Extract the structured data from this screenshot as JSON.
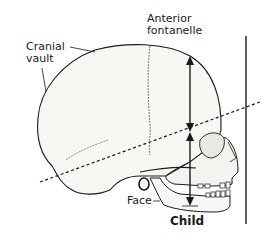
{
  "figure": {
    "type": "anatomical-illustration",
    "labels": {
      "cranial_vault_line1": "Cranial",
      "cranial_vault_line2": "vault",
      "anterior_fontanelle_line1": "Anterior",
      "anterior_fontanelle_line2": "fontanelle",
      "face": "Face",
      "caption": "Child"
    },
    "annotations": [
      {
        "name": "cranial-height-arrow",
        "kind": "double-arrow",
        "orientation": "vertical"
      },
      {
        "name": "face-height-arrow",
        "kind": "double-arrow",
        "orientation": "vertical"
      },
      {
        "name": "orbital-plane-line",
        "kind": "dashed-line"
      },
      {
        "name": "vertical-reference-line",
        "kind": "solid-line"
      }
    ],
    "colors": {
      "ink": "#1a1a1a",
      "bone_fill": "#f7f7f4",
      "background": "#ffffff"
    }
  }
}
